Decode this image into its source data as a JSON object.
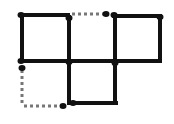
{
  "diagram": {
    "type": "matchstick-squares-puzzle",
    "stroke_color": "#111111",
    "dotted_color": "#777777",
    "solid_segments": [
      {
        "x1": 21,
        "y1": 15,
        "x2": 68,
        "y2": 15
      },
      {
        "x1": 114,
        "y1": 16,
        "x2": 160,
        "y2": 16
      },
      {
        "x1": 21,
        "y1": 61,
        "x2": 160,
        "y2": 61
      },
      {
        "x1": 22,
        "y1": 15,
        "x2": 22,
        "y2": 61
      },
      {
        "x1": 69,
        "y1": 17,
        "x2": 69,
        "y2": 103
      },
      {
        "x1": 115,
        "y1": 15,
        "x2": 115,
        "y2": 103
      },
      {
        "x1": 160,
        "y1": 16,
        "x2": 160,
        "y2": 61
      },
      {
        "x1": 69,
        "y1": 103,
        "x2": 116,
        "y2": 103
      }
    ],
    "dotted_segments": [
      {
        "x1": 72,
        "y1": 14,
        "x2": 104,
        "y2": 14
      },
      {
        "x1": 22,
        "y1": 70,
        "x2": 22,
        "y2": 106
      },
      {
        "x1": 24,
        "y1": 106,
        "x2": 60,
        "y2": 106
      }
    ],
    "dots": [
      {
        "cx": 21,
        "cy": 15
      },
      {
        "cx": 69,
        "cy": 18
      },
      {
        "cx": 106,
        "cy": 14
      },
      {
        "cx": 114,
        "cy": 15
      },
      {
        "cx": 160,
        "cy": 17
      },
      {
        "cx": 21,
        "cy": 61
      },
      {
        "cx": 22,
        "cy": 68
      },
      {
        "cx": 69,
        "cy": 62
      },
      {
        "cx": 115,
        "cy": 63
      },
      {
        "cx": 63,
        "cy": 106
      },
      {
        "cx": 73,
        "cy": 103
      }
    ]
  }
}
